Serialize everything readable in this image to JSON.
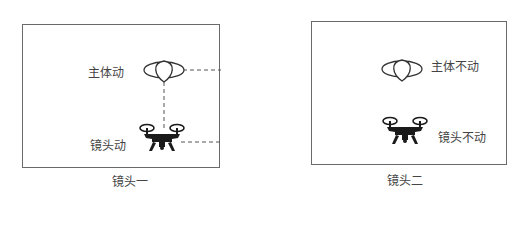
{
  "panels": [
    {
      "caption": "镜头一",
      "subject_label": "主体动",
      "camera_label": "镜头动",
      "subject_icon": "balloon-icon",
      "camera_icon": "drone-icon",
      "connector_style": "dashed"
    },
    {
      "caption": "镜头二",
      "subject_label": "主体不动",
      "camera_label": "镜头不动",
      "subject_icon": "balloon-icon",
      "camera_icon": "drone-icon"
    }
  ],
  "colors": {
    "frame": "#6a6a6a",
    "text": "#444444",
    "drone": "#1a1a1a",
    "dash": "#555555"
  }
}
